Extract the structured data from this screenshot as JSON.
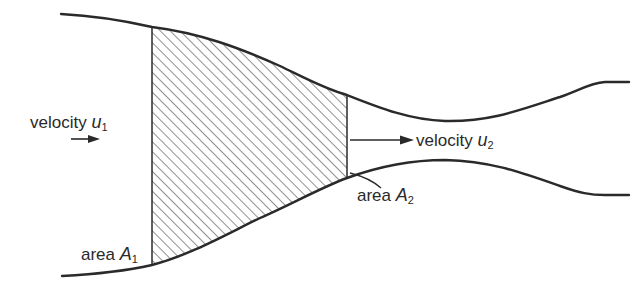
{
  "diagram": {
    "type": "converging-diverging duct (control volume between two sections)",
    "colors": {
      "ink": "#2a2a2a",
      "hatch": "#555555",
      "background": "#ffffff"
    },
    "labels": {
      "inlet_velocity": {
        "word": "velocity",
        "symbol": "u",
        "subscript": "1"
      },
      "outlet_velocity": {
        "word": "velocity",
        "symbol": "u",
        "subscript": "2"
      },
      "inlet_area": {
        "word": "area",
        "symbol": "A",
        "subscript": "1"
      },
      "outlet_area": {
        "word": "area",
        "symbol": "A",
        "subscript": "2"
      }
    },
    "elements": {
      "upper_wall": "pipe upper wall curve",
      "lower_wall": "pipe lower wall curve",
      "section_1": "vertical inlet section line",
      "section_2": "vertical outlet section line",
      "control_volume": "hatched region between sections",
      "arrow_1": "right-pointing arrow (inlet flow)",
      "arrow_2": "right-pointing arrow (outlet flow)"
    }
  }
}
